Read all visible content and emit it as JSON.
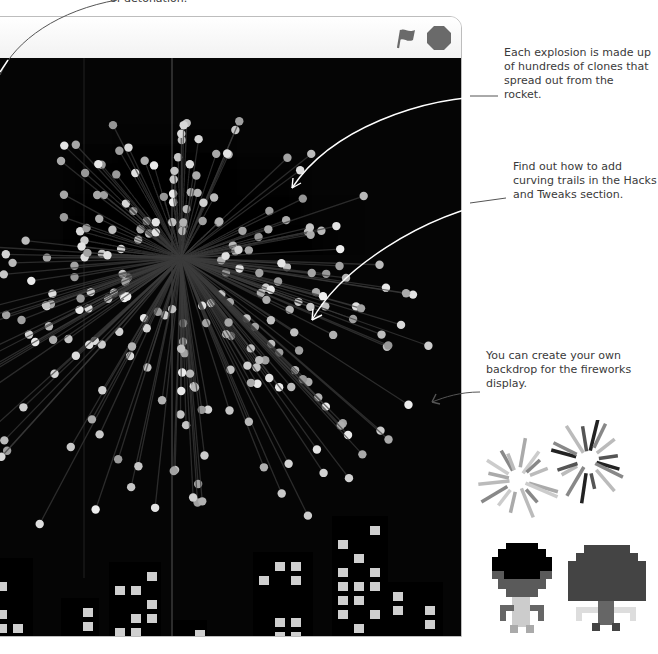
{
  "stage": {
    "header": {
      "green_flag_icon": "green-flag-icon",
      "stop_icon": "stop-sign-icon"
    },
    "backdrop": {
      "sky_color": "#050505",
      "building_color": "#000000",
      "window_color": "#cfcfcf"
    },
    "firework": {
      "center": [
        190,
        240
      ],
      "particle_color": "#bfbfbf",
      "trail_color": "#3a3a3a"
    }
  },
  "annotations": {
    "top_fragment": "of detonation.",
    "clones": "Each explosion is made up of hundreds of clones that spread out from the rocket.",
    "trails": "Find out how to add curving trails in the Hacks and Tweaks section.",
    "backdrop": "You can create your own backdrop for the fireworks display."
  },
  "sprites": {
    "explosion_costumes": [
      "explosion-costume-light",
      "explosion-costume-dark"
    ],
    "rocket_costumes": [
      "rocket-costume-1",
      "rocket-costume-2"
    ]
  }
}
